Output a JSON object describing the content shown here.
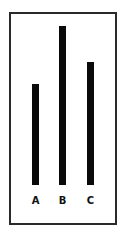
{
  "chart_data": {
    "type": "bar",
    "title": "",
    "xlabel": "",
    "ylabel": "",
    "categories": [
      "A",
      "B",
      "C"
    ],
    "values": [
      101,
      159,
      123
    ],
    "relative_values_pct_of_max": [
      64,
      100,
      77
    ],
    "ylim": [
      0,
      159
    ],
    "grid": false,
    "legend": null,
    "colors": {
      "bar": "#0a0a0a",
      "frame": "#2a2a2a",
      "background": "#ffffff"
    }
  },
  "labels": {
    "a": "A",
    "b": "B",
    "c": "C"
  }
}
